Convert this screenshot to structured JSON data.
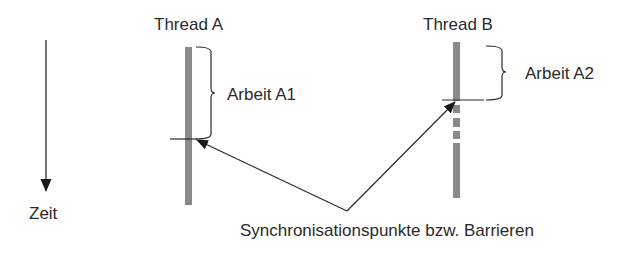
{
  "diagram": {
    "time_axis": {
      "label": "Zeit",
      "direction": "down"
    },
    "threads": [
      {
        "name": "Thread A",
        "work_label": "Arbeit A1",
        "bar_color": "#8a8a8a"
      },
      {
        "name": "Thread B",
        "work_label": "Arbeit A2",
        "bar_color": "#8a8a8a"
      }
    ],
    "caption": "Synchronisationspunkte bzw. Barrieren",
    "colors": {
      "line": "#2a2a2a",
      "bar": "#8a8a8a",
      "background": "#ffffff"
    }
  }
}
